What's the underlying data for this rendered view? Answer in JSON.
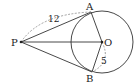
{
  "diagram": {
    "type": "geometry-tangent-lines",
    "points": {
      "P": {
        "label": "P",
        "x": 21,
        "y": 42
      },
      "A": {
        "label": "A",
        "x": 91,
        "y": 12
      },
      "B": {
        "label": "B",
        "x": 92,
        "y": 72
      },
      "O": {
        "label": "O",
        "x": 102,
        "y": 42
      }
    },
    "circle": {
      "center": "O",
      "radius": 31
    },
    "segments": [
      {
        "from": "P",
        "to": "A"
      },
      {
        "from": "P",
        "to": "B"
      },
      {
        "from": "P",
        "to": "O"
      },
      {
        "from": "O",
        "to": "A"
      },
      {
        "from": "O",
        "to": "B"
      }
    ],
    "measurements": [
      {
        "label": "12",
        "segment": "PA",
        "style": "dashed-arc"
      },
      {
        "label": "5",
        "segment": "OB",
        "style": "dashed-arc"
      }
    ],
    "colors": {
      "stroke": "#333333",
      "dashed": "#888888"
    }
  }
}
